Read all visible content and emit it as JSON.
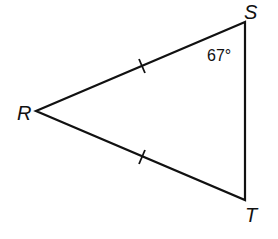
{
  "diagram": {
    "type": "isosceles-triangle",
    "vertices": [
      {
        "name": "S",
        "x": 245,
        "y": 22
      },
      {
        "name": "R",
        "x": 36,
        "y": 111
      },
      {
        "name": "T",
        "x": 245,
        "y": 200
      }
    ],
    "labels": {
      "S": "S",
      "R": "R",
      "T": "T",
      "angle_S": "67°"
    },
    "congruent_sides": [
      "RS",
      "RT"
    ],
    "tick_marks": [
      {
        "side": "RS",
        "x": 142,
        "y": 66
      },
      {
        "side": "RT",
        "x": 142,
        "y": 157
      }
    ],
    "colors": {
      "stroke": "#111111",
      "background": "#ffffff"
    }
  }
}
